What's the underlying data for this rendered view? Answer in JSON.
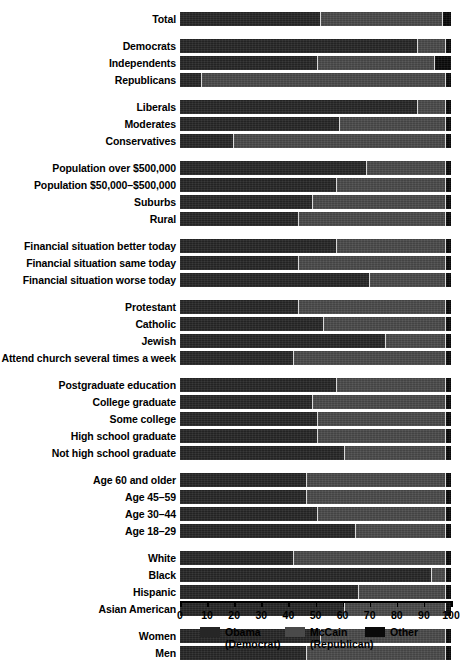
{
  "chart_data": {
    "type": "bar",
    "subtype": "stacked-horizontal-100",
    "title": "",
    "xlabel": "",
    "ylabel": "",
    "xlim": [
      0,
      100
    ],
    "grid": false,
    "legend_position": "bottom-center",
    "axis_ticks": [
      0,
      10,
      20,
      30,
      40,
      50,
      60,
      70,
      80,
      90,
      100
    ],
    "series": [
      {
        "name": "Obama",
        "sub": "(Democrat)",
        "color": "#262626"
      },
      {
        "name": "McCain",
        "sub": "(Republican)",
        "color": "#4a4a4a"
      },
      {
        "name": "Other",
        "sub": "",
        "color": "#0a0a0a"
      }
    ],
    "groups": [
      {
        "name": "total",
        "rows": [
          {
            "label": "Total",
            "values": [
              52,
              45,
              3
            ]
          }
        ]
      },
      {
        "name": "party",
        "rows": [
          {
            "label": "Democrats",
            "values": [
              88,
              10,
              2
            ]
          },
          {
            "label": "Independents",
            "values": [
              51,
              43,
              6
            ]
          },
          {
            "label": "Republicans",
            "values": [
              8,
              90,
              2
            ]
          }
        ]
      },
      {
        "name": "ideology",
        "rows": [
          {
            "label": "Liberals",
            "values": [
              88,
              10,
              2
            ]
          },
          {
            "label": "Moderates",
            "values": [
              59,
              39,
              2
            ]
          },
          {
            "label": "Conservatives",
            "values": [
              20,
              78,
              2
            ]
          }
        ]
      },
      {
        "name": "community-size",
        "rows": [
          {
            "label": "Population over $500,000",
            "values": [
              69,
              29,
              2
            ]
          },
          {
            "label": "Population $50,000–$500,000",
            "values": [
              58,
              40,
              2
            ]
          },
          {
            "label": "Suburbs",
            "values": [
              49,
              49,
              2
            ]
          },
          {
            "label": "Rural",
            "values": [
              44,
              54,
              2
            ]
          }
        ]
      },
      {
        "name": "financial-situation",
        "rows": [
          {
            "label": "Financial situation better today",
            "values": [
              58,
              40,
              2
            ]
          },
          {
            "label": "Financial situation same today",
            "values": [
              44,
              54,
              2
            ]
          },
          {
            "label": "Financial situation worse today",
            "values": [
              70,
              28,
              2
            ]
          }
        ]
      },
      {
        "name": "religion",
        "rows": [
          {
            "label": "Protestant",
            "values": [
              44,
              54,
              2
            ]
          },
          {
            "label": "Catholic",
            "values": [
              53,
              45,
              2
            ]
          },
          {
            "label": "Jewish",
            "values": [
              76,
              22,
              2
            ]
          },
          {
            "label": "Attend church several times a week",
            "values": [
              42,
              56,
              2
            ]
          }
        ]
      },
      {
        "name": "education",
        "rows": [
          {
            "label": "Postgraduate education",
            "values": [
              58,
              40,
              2
            ]
          },
          {
            "label": "College graduate",
            "values": [
              49,
              49,
              2
            ]
          },
          {
            "label": "Some college",
            "values": [
              51,
              47,
              2
            ]
          },
          {
            "label": "High school graduate",
            "values": [
              51,
              47,
              2
            ]
          },
          {
            "label": "Not high school graduate",
            "values": [
              61,
              37,
              2
            ]
          }
        ]
      },
      {
        "name": "age",
        "rows": [
          {
            "label": "Age 60 and older",
            "values": [
              47,
              51,
              2
            ]
          },
          {
            "label": "Age 45–59",
            "values": [
              47,
              51,
              2
            ]
          },
          {
            "label": "Age 30–44",
            "values": [
              51,
              47,
              2
            ]
          },
          {
            "label": "Age 18–29",
            "values": [
              65,
              33,
              2
            ]
          }
        ]
      },
      {
        "name": "race",
        "rows": [
          {
            "label": "White",
            "values": [
              42,
              56,
              2
            ]
          },
          {
            "label": "Black",
            "values": [
              93,
              5,
              2
            ]
          },
          {
            "label": "Hispanic",
            "values": [
              66,
              32,
              2
            ]
          },
          {
            "label": "Asian American",
            "values": [
              61,
              37,
              2
            ]
          }
        ]
      },
      {
        "name": "gender",
        "rows": [
          {
            "label": "Women",
            "values": [
              52,
              46,
              2
            ]
          },
          {
            "label": "Men",
            "values": [
              47,
              51,
              2
            ]
          }
        ]
      }
    ]
  },
  "legend": {
    "items": [
      {
        "label": "Obama",
        "sub": "(Democrat)"
      },
      {
        "label": "McCain",
        "sub": "(Republican)"
      },
      {
        "label": "Other",
        "sub": ""
      }
    ]
  }
}
